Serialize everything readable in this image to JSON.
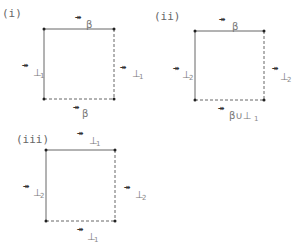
{
  "arrow_glyph": "↠",
  "panels": [
    {
      "label": "(i)",
      "square": {
        "x1": 44,
        "y1": 29,
        "x2": 114,
        "y2": 99
      },
      "edges": {
        "top": {
          "style": "solid",
          "symbol": "β",
          "sub": ""
        },
        "left": {
          "style": "solid",
          "symbol": "⊥",
          "sub": "1"
        },
        "right": {
          "style": "dashed",
          "symbol": "⊥",
          "sub": "1"
        },
        "bottom": {
          "style": "dashed",
          "symbol": "β",
          "sub": ""
        }
      }
    },
    {
      "label": "(ii)",
      "square": {
        "x1": 195,
        "y1": 31,
        "x2": 264,
        "y2": 100
      },
      "edges": {
        "top": {
          "style": "solid",
          "symbol": "β",
          "sub": ""
        },
        "left": {
          "style": "solid",
          "symbol": "⊥",
          "sub": "2"
        },
        "right": {
          "style": "dashed",
          "symbol": "⊥",
          "sub": "2"
        },
        "bottom": {
          "style": "dashed",
          "symbol": "β∪⊥",
          "sub": "1"
        }
      }
    },
    {
      "label": "(iii)",
      "square": {
        "x1": 46,
        "y1": 150,
        "x2": 115,
        "y2": 221
      },
      "edges": {
        "top": {
          "style": "solid",
          "symbol": "⊥",
          "sub": "1"
        },
        "left": {
          "style": "solid",
          "symbol": "⊥",
          "sub": "2"
        },
        "right": {
          "style": "dashed",
          "symbol": "⊥",
          "sub": "2"
        },
        "bottom": {
          "style": "dashed",
          "symbol": "⊥",
          "sub": "1"
        }
      }
    }
  ]
}
